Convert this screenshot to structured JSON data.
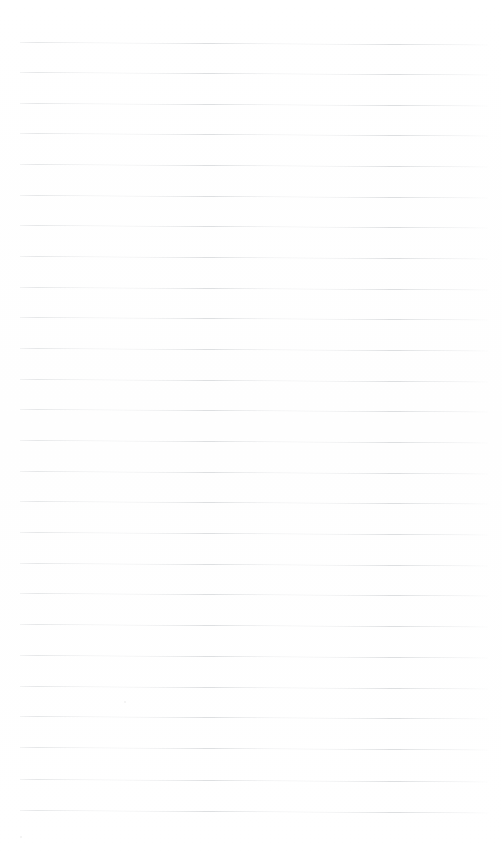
{
  "document": {
    "type": "lined-notebook-page",
    "title": "Blank ruled notebook page",
    "page_width": 502,
    "page_height": 856,
    "background_color": "#ffffff",
    "content_text": "",
    "is_blank": true
  },
  "ruling": {
    "line_color": "#dddfe1",
    "line_thickness_px": 1,
    "line_spacing_px": 30.5,
    "first_line_y": 42,
    "last_line_y": 810,
    "line_start_x": 20,
    "line_end_x": 488,
    "line_count": 26,
    "skew_degrees": 0.32,
    "margin_left_px": 20,
    "margin_right_px": 14,
    "margin_top_px": 42,
    "margin_bottom_px": 46,
    "has_vertical_margin_rule": false,
    "has_holes": false
  },
  "lines": [
    {
      "index": 1,
      "y": 42
    },
    {
      "index": 2,
      "y": 72
    },
    {
      "index": 3,
      "y": 103
    },
    {
      "index": 4,
      "y": 133
    },
    {
      "index": 5,
      "y": 164
    },
    {
      "index": 6,
      "y": 195
    },
    {
      "index": 7,
      "y": 225
    },
    {
      "index": 8,
      "y": 256
    },
    {
      "index": 9,
      "y": 287
    },
    {
      "index": 10,
      "y": 317
    },
    {
      "index": 11,
      "y": 348
    },
    {
      "index": 12,
      "y": 379
    },
    {
      "index": 13,
      "y": 409
    },
    {
      "index": 14,
      "y": 440
    },
    {
      "index": 15,
      "y": 471
    },
    {
      "index": 16,
      "y": 501
    },
    {
      "index": 17,
      "y": 532
    },
    {
      "index": 18,
      "y": 563
    },
    {
      "index": 19,
      "y": 593
    },
    {
      "index": 20,
      "y": 624
    },
    {
      "index": 21,
      "y": 655
    },
    {
      "index": 22,
      "y": 686
    },
    {
      "index": 23,
      "y": 716
    },
    {
      "index": 24,
      "y": 747
    },
    {
      "index": 25,
      "y": 779
    },
    {
      "index": 26,
      "y": 810
    }
  ],
  "artifacts": [
    {
      "name": "scan-speck",
      "x": 124,
      "y": 701,
      "size": 2
    },
    {
      "name": "scan-speck",
      "x": 20,
      "y": 836,
      "size": 2
    }
  ]
}
